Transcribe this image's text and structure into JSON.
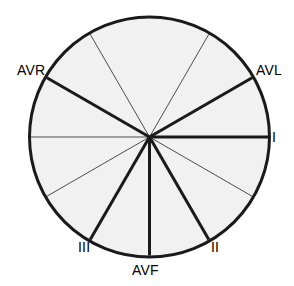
{
  "diagram": {
    "type": "hexaxial-reference-system",
    "geometry": {
      "center_x": 149.5,
      "center_y": 137,
      "radius": 120,
      "sector_step_degrees": 30,
      "sector_count": 12
    },
    "colors": {
      "sector_fill": "#f1f1f1",
      "outer_circle_stroke": "#1a1a1a",
      "lead_axis_stroke": "#1a1a1a",
      "minor_spoke_stroke": "#4d4d4d",
      "label_color": "#000000",
      "background": "#ffffff"
    },
    "strokes": {
      "outer_circle_width": 3,
      "lead_axis_width": 3,
      "minor_spoke_width": 1
    },
    "lead_axes": [
      {
        "id": "lead-i",
        "label": "I",
        "angle_degrees": 0,
        "thick": true
      },
      {
        "id": "lead-ii",
        "label": "II",
        "angle_degrees": -60,
        "thick": true
      },
      {
        "id": "lead-iii",
        "label": "III",
        "angle_degrees": -120,
        "thick": true
      },
      {
        "id": "lead-avr",
        "label": "AVR",
        "angle_degrees": 150,
        "thick": true
      },
      {
        "id": "lead-avl",
        "label": "AVL",
        "angle_degrees": 30,
        "thick": true
      },
      {
        "id": "lead-avf",
        "label": "AVF",
        "angle_degrees": -90,
        "thick": true
      }
    ],
    "minor_spokes": [
      {
        "id": "spoke-60",
        "angle_degrees": 60
      },
      {
        "id": "spoke-120",
        "angle_degrees": 120
      },
      {
        "id": "spoke-180",
        "angle_degrees": 180
      },
      {
        "id": "spoke-210",
        "angle_degrees": 210
      },
      {
        "id": "spoke-330",
        "angle_degrees": 330
      }
    ],
    "labels": {
      "avr": "AVR",
      "avl": "AVL",
      "lead_i": "I",
      "lead_ii": "II",
      "lead_iii": "III",
      "avf": "AVF"
    }
  },
  "chart_data": {
    "type": "pie",
    "xlabel": "",
    "ylabel": "",
    "categories": [
      "0° to 30°",
      "30° to 60°",
      "60° to 90°",
      "90° to 120°",
      "120° to 150°",
      "150° to 180°",
      "180° to 210°",
      "210° to 240°",
      "240° to 270°",
      "270° to 300°",
      "300° to 330°",
      "330° to 360°"
    ],
    "values": [
      30,
      30,
      30,
      30,
      30,
      30,
      30,
      30,
      30,
      30,
      30,
      30
    ],
    "annotations": [
      {
        "text": "I",
        "angle_degrees": 0
      },
      {
        "text": "AVL",
        "angle_degrees": 30
      },
      {
        "text": "AVR",
        "angle_degrees": 150
      },
      {
        "text": "III",
        "angle_degrees": 240
      },
      {
        "text": "AVF",
        "angle_degrees": 270
      },
      {
        "text": "II",
        "angle_degrees": 300
      }
    ],
    "legend_position": "none",
    "grid": false
  }
}
